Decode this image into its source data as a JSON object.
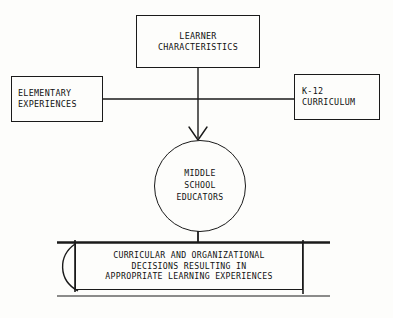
{
  "diagram": {
    "ink_color": "#1a1a1a",
    "background_color": "#fdfdfb",
    "nodes": {
      "learner": {
        "shape": "rectangle",
        "lines": [
          "LEARNER",
          "CHARACTERISTICS"
        ]
      },
      "elementary": {
        "shape": "rectangle",
        "lines": [
          "ELEMENTARY",
          "EXPERIENCES"
        ]
      },
      "k12": {
        "shape": "rectangle",
        "lines": [
          "K-12",
          "CURRICULUM"
        ]
      },
      "educators": {
        "shape": "circle",
        "lines": [
          "MIDDLE",
          "SCHOOL",
          "EDUCATORS"
        ]
      },
      "outcome": {
        "shape": "rectangle",
        "lines": [
          "CURRICULAR AND ORGANIZATIONAL",
          "DECISIONS RESULTING IN",
          "APPROPRIATE LEARNING EXPERIENCES"
        ]
      }
    },
    "connectors": [
      {
        "name": "learner-to-educators",
        "from": "learner",
        "to": "educators",
        "style": "straight-line-with-arrowhead",
        "arrowhead": "open-v"
      },
      {
        "name": "elementary-to-k12-horizontal",
        "from": "elementary",
        "to": "k12",
        "style": "straight-line",
        "arrowhead": "none"
      },
      {
        "name": "educators-to-outcome",
        "from": "educators",
        "to": "outcome",
        "style": "short-stem",
        "arrowhead": "none"
      },
      {
        "name": "outcome-feedback-loop",
        "from": "outcome",
        "to": "outcome",
        "style": "left-side-arc",
        "arrowhead": "none"
      }
    ]
  }
}
